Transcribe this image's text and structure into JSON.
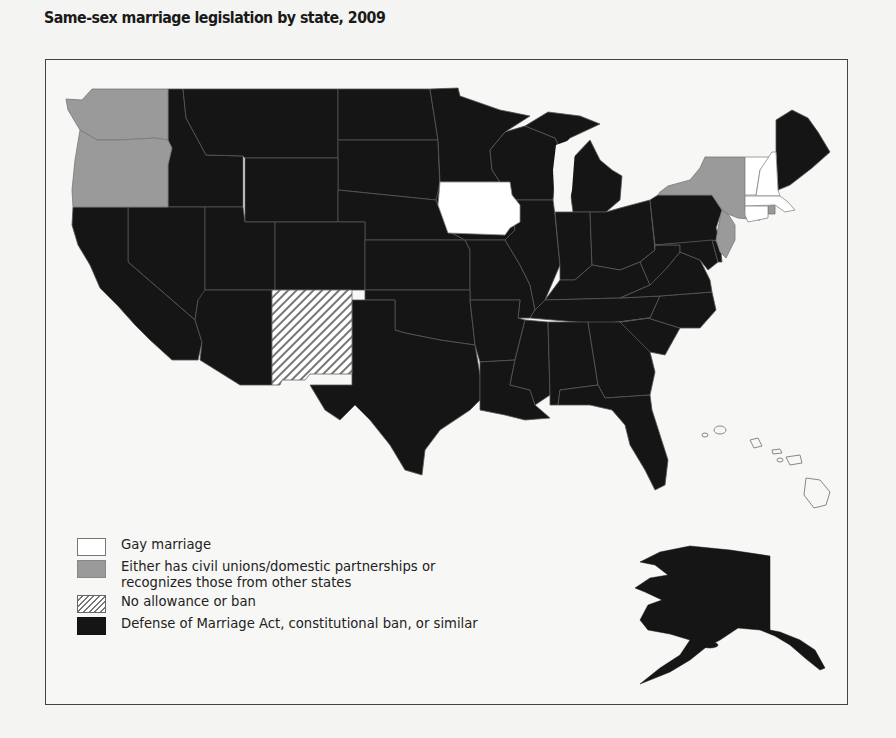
{
  "title": "Same-sex marriage legislation by state, 2009",
  "colors": {
    "gay_marriage": "#ffffff",
    "civil_unions": "#9a9a9a",
    "no_allowance": "hatched",
    "doma_ban": "#151515"
  },
  "legend": [
    {
      "key": "gay_marriage",
      "label": "Gay marriage"
    },
    {
      "key": "civil_unions",
      "label": "Either has civil unions/domestic partnerships or recognizes those from other states"
    },
    {
      "key": "no_allowance",
      "label": "No allowance or ban"
    },
    {
      "key": "doma_ban",
      "label": "Defense of Marriage Act, constitutional ban, or similar"
    }
  ],
  "states": {
    "gay_marriage": [
      "Iowa",
      "Vermont",
      "New Hampshire",
      "Massachusetts",
      "Connecticut"
    ],
    "civil_unions": [
      "Washington",
      "Oregon",
      "New York",
      "New Jersey",
      "Rhode Island"
    ],
    "no_allowance": [
      "New Mexico"
    ],
    "unfilled_outline": [
      "Hawaii"
    ],
    "doma_ban": [
      "Idaho",
      "Montana",
      "Wyoming",
      "Nevada",
      "Utah",
      "Colorado",
      "Arizona",
      "California",
      "North Dakota",
      "South Dakota",
      "Nebraska",
      "Kansas",
      "Oklahoma",
      "Texas",
      "Minnesota",
      "Missouri",
      "Arkansas",
      "Louisiana",
      "Wisconsin",
      "Illinois",
      "Michigan",
      "Indiana",
      "Ohio",
      "Kentucky",
      "Tennessee",
      "Mississippi",
      "Alabama",
      "Georgia",
      "Florida",
      "South Carolina",
      "North Carolina",
      "Virginia",
      "West Virginia",
      "Pennsylvania",
      "Maryland",
      "Delaware",
      "Maine",
      "Alaska"
    ]
  }
}
